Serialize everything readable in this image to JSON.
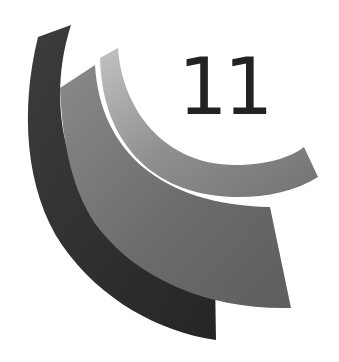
{
  "logo": {
    "number": "11",
    "colors": {
      "outer_band": "#343434",
      "middle_band": "#6b6b6b",
      "inner_band_light": "#b5b5b5",
      "inner_band_dark": "#7a7a7a",
      "text": "#222222",
      "background": "#ffffff"
    }
  }
}
